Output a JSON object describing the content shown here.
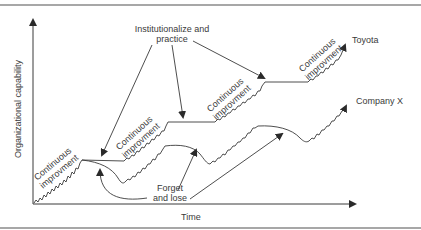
{
  "diagram": {
    "title_partial_top": "",
    "y_axis_label": "Organizational capability",
    "x_axis_label": "Time",
    "callouts": {
      "institutionalize": [
        "Institutionalize and",
        "practice"
      ],
      "forget": [
        "Forget",
        "and lose"
      ]
    },
    "segment_label": [
      "Continuous",
      "improvment"
    ],
    "segment_label_first": [
      "Continuous",
      "improvment"
    ],
    "series": [
      {
        "name": "Toyota",
        "color": "#3a3a3a"
      },
      {
        "name": "Company X",
        "color": "#3a3a3a"
      }
    ],
    "colors": {
      "line": "#3a3a3a",
      "rule": "#8a8a8a",
      "background": "#ffffff"
    }
  }
}
